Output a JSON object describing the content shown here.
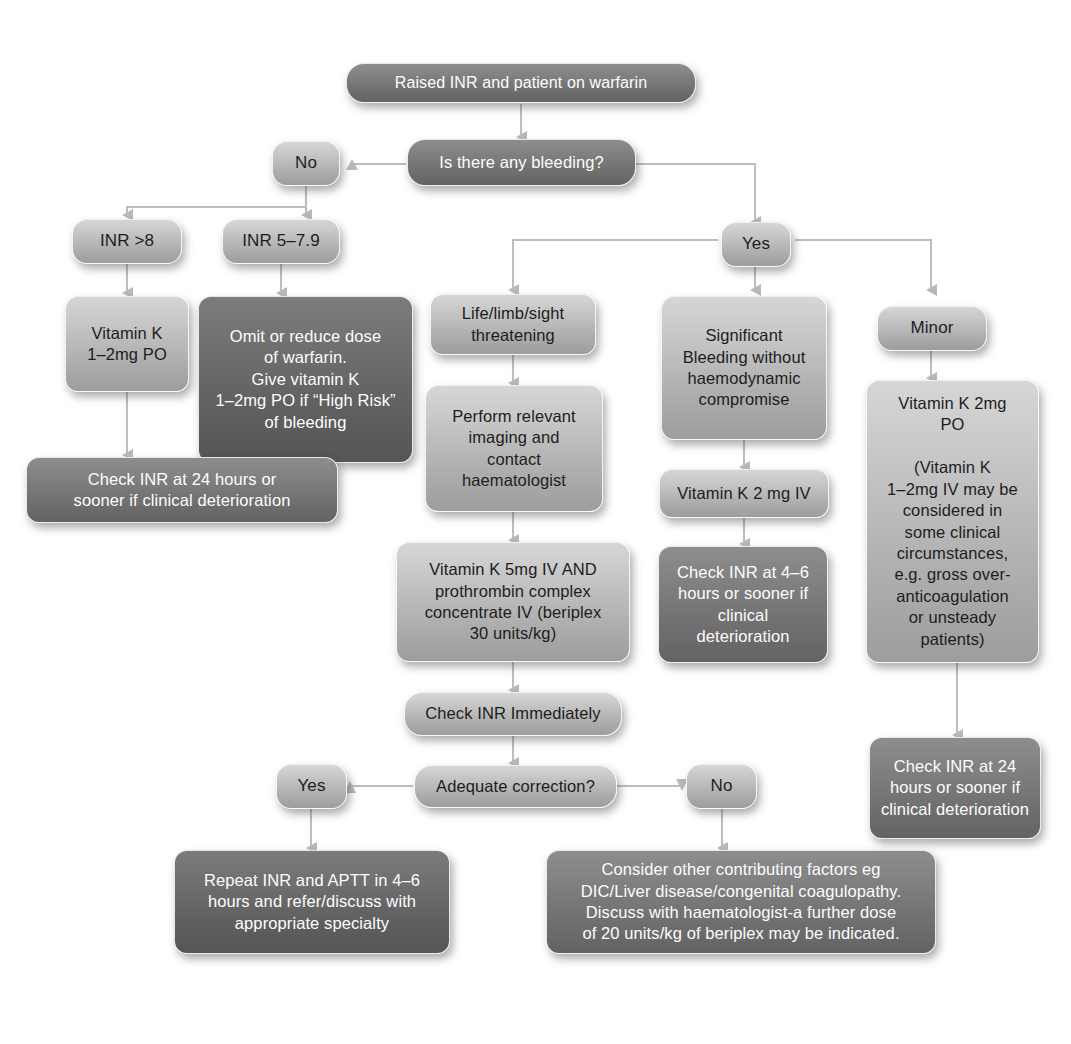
{
  "diagram": {
    "colors": {
      "background": "#ffffff",
      "box_light": "#d2d2d2",
      "box_mid": "#b8b8b8",
      "box_dark": "#757575",
      "box_darker": "#656565",
      "text_dark": "#1d1d1d",
      "text_light": "#fdfdfd",
      "connector": "#b5b5b5"
    }
  },
  "nodes": {
    "start": "Raised INR and patient on warfarin",
    "bleeding_question": "Is there any bleeding?",
    "answer_no": "No",
    "answer_yes": "Yes",
    "inr_over_8": "INR >8",
    "inr_5_79": "INR 5–7.9",
    "vitamin_k_1_2mg_po": "Vitamin K\n1–2mg PO",
    "omit_reduce_warfarin": "Omit or reduce dose\nof warfarin.\nGive vitamin K\n1–2mg PO if “High Risk”\nof bleeding",
    "check_inr_24h_left": "Check INR at 24 hours or\nsooner if clinical deterioration",
    "life_limb_sight": "Life/limb/sight\nthreatening",
    "perform_imaging": "Perform relevant\nimaging and\ncontact\nhaematologist",
    "vitamin_k_5mg_pcc": "Vitamin K 5mg IV AND\nprothrombin complex\nconcentrate IV (beriplex\n30 units/kg)",
    "significant_bleeding": "Significant\nBleeding without\nhaemodynamic\ncompromise",
    "vitamin_k_2mg_iv": "Vitamin K 2 mg IV",
    "check_inr_4_6h": "Check INR at 4–6\nhours or sooner if\nclinical\ndeterioration",
    "minor": "Minor",
    "vitamin_k_2mg_po": "Vitamin K 2mg\nPO\n\n(Vitamin K\n1–2mg IV may be\nconsidered in\nsome clinical\ncircumstances,\ne.g. gross over-\nanticoagulation\nor unsteady\npatients)",
    "check_inr_24h_right": "Check INR at 24\nhours or sooner if\nclinical deterioration",
    "check_inr_immediately": "Check INR Immediately",
    "adequate_correction": "Adequate correction?",
    "adequate_yes": "Yes",
    "adequate_no": "No",
    "repeat_inr_aptt": "Repeat INR and APTT in 4–6\nhours and refer/discuss with\nappropriate specialty",
    "consider_other_factors": "Consider other contributing factors eg\nDIC/Liver disease/congenital coagulopathy.\nDiscuss with haematologist-a further dose\nof 20 units/kg of beriplex may be indicated."
  }
}
